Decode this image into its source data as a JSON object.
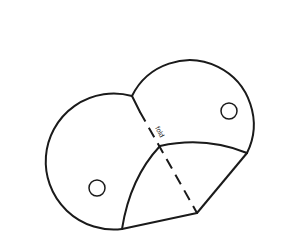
{
  "diagram": {
    "type": "geometric-figure",
    "fold_label": "fold",
    "line_color": "#1a1a1a",
    "background_color": "#ffffff",
    "elements": [
      {
        "name": "left-circle-arc",
        "kind": "arc"
      },
      {
        "name": "right-circle-arc",
        "kind": "arc"
      },
      {
        "name": "fold-line",
        "kind": "dashed-line"
      },
      {
        "name": "folded-flap",
        "kind": "region"
      },
      {
        "name": "left-hole",
        "kind": "small-circle"
      },
      {
        "name": "right-hole",
        "kind": "small-circle"
      }
    ]
  }
}
